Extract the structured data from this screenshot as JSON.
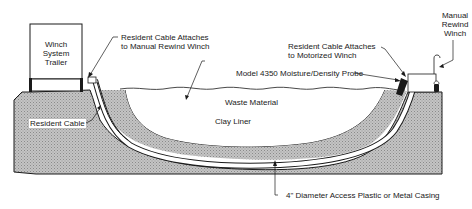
{
  "diagram": {
    "type": "cross-section",
    "colors": {
      "ground_fill": "#b8b8b8",
      "outline": "#1a1a1a",
      "background": "#ffffff"
    },
    "labels": {
      "winch_trailer": [
        "Winch",
        "System",
        "Trailer"
      ],
      "resident_cable_manual": [
        "Resident Cable Attaches",
        "to Manual Rewind Winch"
      ],
      "resident_cable_motorized": [
        "Resident Cable Attaches",
        "to Motorized Winch"
      ],
      "manual_rewind_winch": [
        "Manual",
        "Rewind",
        "Winch"
      ],
      "probe": "Model 4350 Moisture/Density Probe",
      "waste_material": "Waste Material",
      "resident_cable": "Resident Cable",
      "clay_liner": "Clay Liner",
      "casing": "4\" Diameter Access Plastic or Metal Casing"
    }
  }
}
